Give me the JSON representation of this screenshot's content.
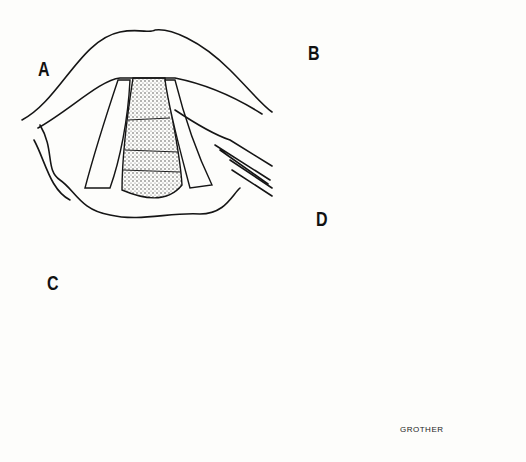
{
  "figure": {
    "panels": [
      {
        "id": "A",
        "label": "A",
        "description": "Larynx view with vocal fold incision using scalpel"
      },
      {
        "id": "B",
        "label": "B",
        "description": "Detail of flap elevation with directional arrows"
      },
      {
        "id": "C",
        "label": "C",
        "description": "Removal of lesion with forceps"
      },
      {
        "id": "D",
        "label": "D",
        "description": "Larynx view after procedure with dashed incision line"
      }
    ],
    "signature": "GROTHER"
  },
  "colors": {
    "ink": "#151515",
    "paper": "#fdfdfb",
    "shade": "#555555"
  }
}
